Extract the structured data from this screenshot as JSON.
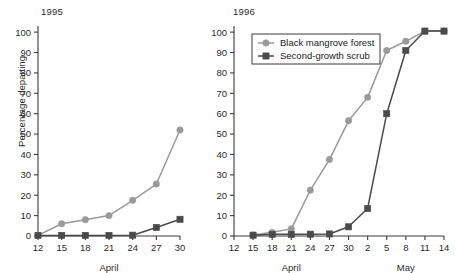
{
  "figure": {
    "ylabel": "Percentage departing",
    "y_ticks": [
      0,
      10,
      20,
      30,
      40,
      50,
      60,
      70,
      80,
      90,
      100
    ],
    "ylim": [
      0,
      103
    ],
    "colors": {
      "black_mangrove_forest": "#9a9a9a",
      "second_growth_scrub": "#4a4a4a",
      "axis": "#3a3a3a",
      "background": "#ffffff"
    },
    "legend": {
      "position": "upper-left-of-right-panel",
      "entries": [
        {
          "label": "Black mangrove forest",
          "marker": "circle",
          "color": "#9a9a9a"
        },
        {
          "label": "Second-growth scrub",
          "marker": "square",
          "color": "#4a4a4a"
        }
      ]
    }
  },
  "chart_data": [
    {
      "type": "line",
      "title": "1995",
      "xlabel": "April",
      "ylabel": "Percentage departing",
      "ylim": [
        0,
        103
      ],
      "grid": false,
      "categories": [
        "12",
        "15",
        "18",
        "21",
        "24",
        "27",
        "30"
      ],
      "month_spans": [
        {
          "label": "April",
          "from": "12",
          "to": "30"
        }
      ],
      "series": [
        {
          "name": "Black mangrove forest",
          "marker": "circle",
          "color": "#9a9a9a",
          "values": [
            0.3,
            6,
            8,
            10,
            17.5,
            25.5,
            52
          ]
        },
        {
          "name": "Second-growth scrub",
          "marker": "square",
          "color": "#4a4a4a",
          "values": [
            0.3,
            0.3,
            0.3,
            0.3,
            0.4,
            4.2,
            8.2
          ]
        }
      ]
    },
    {
      "type": "line",
      "title": "1996",
      "xlabel": "April / May",
      "ylabel": "Percentage departing",
      "ylim": [
        0,
        103
      ],
      "grid": false,
      "categories": [
        "12",
        "15",
        "18",
        "21",
        "24",
        "27",
        "30",
        "2",
        "5",
        "8",
        "11",
        "14"
      ],
      "month_spans": [
        {
          "label": "April",
          "from": "12",
          "to": "30"
        },
        {
          "label": "May",
          "from": "2",
          "to": "14"
        }
      ],
      "series": [
        {
          "name": "Black mangrove forest",
          "marker": "circle",
          "color": "#9a9a9a",
          "values": [
            null,
            0.5,
            1.8,
            3.5,
            22.5,
            37.5,
            56.5,
            68,
            91,
            95.5,
            100.5,
            100.5
          ]
        },
        {
          "name": "Second-growth scrub",
          "marker": "square",
          "color": "#4a4a4a",
          "values": [
            null,
            0.4,
            0.8,
            0.8,
            0.9,
            1.0,
            4.5,
            13.5,
            60,
            91,
            100.5,
            100.5
          ]
        }
      ]
    }
  ],
  "panels": {
    "left": {
      "title": "1995",
      "month_label": "April",
      "x_ticks": [
        "12",
        "15",
        "18",
        "21",
        "24",
        "27",
        "30"
      ],
      "y_ticks": [
        "0",
        "10",
        "20",
        "30",
        "40",
        "50",
        "60",
        "70",
        "80",
        "90",
        "100"
      ],
      "ylabel": "Percentage departing"
    },
    "right": {
      "title": "1996",
      "month_label_april": "April",
      "month_label_may": "May",
      "x_ticks": [
        "12",
        "15",
        "18",
        "21",
        "24",
        "27",
        "30",
        "2",
        "5",
        "8",
        "11",
        "14"
      ],
      "y_ticks": [
        "0",
        "10",
        "20",
        "30",
        "40",
        "50",
        "60",
        "70",
        "80",
        "90",
        "100"
      ],
      "legend": {
        "item_1": "Black mangrove forest",
        "item_2": "Second-growth scrub"
      }
    }
  }
}
